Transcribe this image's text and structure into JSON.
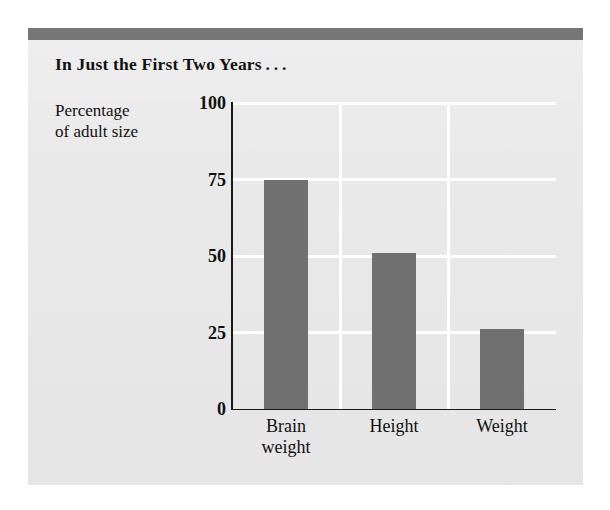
{
  "figure": {
    "title": "In Just the First Two Years . . .",
    "axis_caption_line1": "Percentage",
    "axis_caption_line2": "of adult size",
    "panel_color": "#e9e9e9",
    "band_color": "#767676",
    "bar_color": "#707070",
    "gridline_color": "#ffffff",
    "axis_color": "#1a1a1a"
  },
  "chart_data": {
    "type": "bar",
    "title": "In Just the First Two Years . . .",
    "xlabel": "",
    "ylabel": "Percentage of adult size",
    "categories": [
      "Brain weight",
      "Height",
      "Weight"
    ],
    "category_lines": [
      [
        "Brain",
        "weight"
      ],
      [
        "Height"
      ],
      [
        "Weight"
      ]
    ],
    "values": [
      75,
      51,
      26
    ],
    "ylim": [
      0,
      100
    ],
    "yticks": [
      0,
      25,
      50,
      75,
      100
    ],
    "ytick_labels": [
      "0",
      "25",
      "50",
      "75",
      "100"
    ],
    "grid": "white horizontal gridlines at 25/50/75/100 and vertical separators between categories",
    "legend": "none"
  }
}
